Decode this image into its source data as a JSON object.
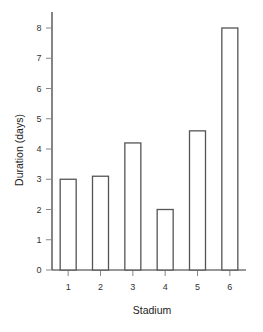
{
  "chart_data": {
    "type": "bar",
    "title": "",
    "xlabel": "Stadium",
    "ylabel": "Duration (days)",
    "categories": [
      "1",
      "2",
      "3",
      "4",
      "5",
      "6"
    ],
    "values": [
      3.0,
      3.1,
      4.2,
      2.0,
      4.6,
      8.0
    ],
    "ylim": [
      0,
      8.5
    ],
    "yticks": [
      0,
      1,
      2,
      3,
      4,
      5,
      6,
      7,
      8
    ],
    "grid": false,
    "legend": null,
    "bar_style": {
      "fill": "#ffffff",
      "stroke": "#555555"
    }
  }
}
